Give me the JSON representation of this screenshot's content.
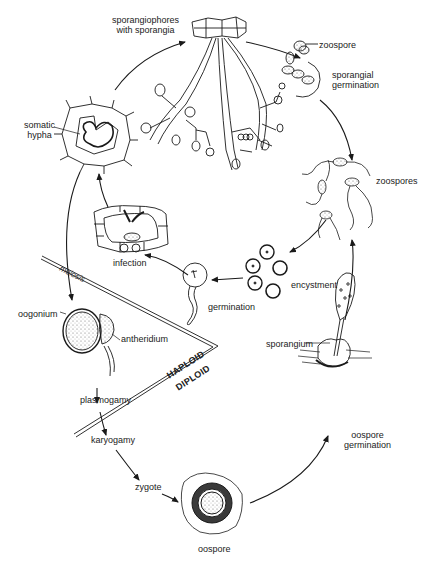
{
  "labels": {
    "sporangiophores": "sporangiophores\nwith sporangia",
    "sporangiophores_line1": "sporangiophores",
    "sporangiophores_line2": "with sporangia",
    "zoospore": "zoospore",
    "sporangial_germination_line1": "sporangial",
    "sporangial_germination_line2": "germination",
    "zoospores": "zoospores",
    "somatic_hypha_line1": "somatic",
    "somatic_hypha_line2": "hypha",
    "infection": "infection",
    "encystment": "encystment",
    "germination": "germination",
    "meiosis": "meiosis",
    "oogonium": "oogonium",
    "antheridium": "antheridium",
    "haploid": "HAPLOID",
    "diploid": "DIPLOID",
    "sporangium": "sporangium",
    "plasmogamy": "plasmogamy",
    "karyogamy": "karyogamy",
    "oospore_germination_line1": "oospore",
    "oospore_germination_line2": "germination",
    "zygote": "zygote",
    "oospore": "oospore"
  },
  "stages": [
    {
      "id": "sporangiophores",
      "label": "sporangiophores with sporangia",
      "next": "sporangial-germination"
    },
    {
      "id": "sporangial-germination",
      "label": "sporangial germination",
      "next": "zoospores"
    },
    {
      "id": "zoospores",
      "label": "zoospores",
      "next": "encystment"
    },
    {
      "id": "encystment",
      "label": "encystment",
      "next": "germination"
    },
    {
      "id": "germination",
      "label": "germination",
      "next": "infection"
    },
    {
      "id": "infection",
      "label": "infection",
      "next": "somatic-hypha"
    },
    {
      "id": "somatic-hypha",
      "label": "somatic hypha",
      "next": [
        "sporangiophores",
        "oogonium"
      ]
    },
    {
      "id": "oogonium",
      "label": "oogonium + antheridium",
      "next": "plasmogamy"
    },
    {
      "id": "plasmogamy",
      "label": "plasmogamy",
      "next": "karyogamy"
    },
    {
      "id": "karyogamy",
      "label": "karyogamy",
      "next": "zygote"
    },
    {
      "id": "zygote",
      "label": "zygote",
      "next": "oospore"
    },
    {
      "id": "oospore",
      "label": "oospore",
      "next": "oospore-germination"
    },
    {
      "id": "oospore-germination",
      "label": "oospore germination (sporangium)",
      "next": "zoospores"
    }
  ],
  "regions": {
    "upper": "HAPLOID",
    "lower": "DIPLOID",
    "boundary_annotation": "meiosis"
  },
  "colors": {
    "ink": "#1a1a1a",
    "background": "#ffffff",
    "stipple": "#555555"
  }
}
